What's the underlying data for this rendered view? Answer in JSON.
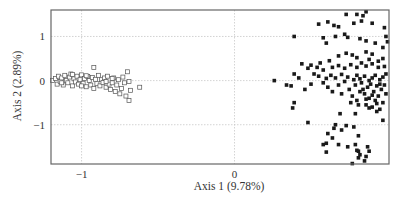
{
  "chart_data": {
    "type": "scatter",
    "title": "",
    "xlabel": "Axis 1 (9.78%)",
    "ylabel": "Axis 2 (2.89%)",
    "xlim": [
      -1.2,
      1.01
    ],
    "ylim": [
      -1.89,
      1.6
    ],
    "xticks": [
      -1,
      0
    ],
    "xtick_labels": [
      "−1",
      "0"
    ],
    "yticks": [
      1,
      0,
      -1
    ],
    "ytick_labels": [
      "1",
      "0",
      "−1"
    ],
    "grid": {
      "vertical_at": [
        -1,
        0
      ],
      "horizontal_at": [
        1,
        0,
        -1
      ],
      "style": "dotted",
      "color": "#c8c8c8"
    },
    "legend": null,
    "series": [
      {
        "name": "group-open-squares",
        "marker": "open-square",
        "color": "#555555",
        "points": [
          [
            -1.19,
            0.0
          ],
          [
            -1.17,
            0.05
          ],
          [
            -1.16,
            -0.08
          ],
          [
            -1.15,
            0.1
          ],
          [
            -1.14,
            -0.02
          ],
          [
            -1.13,
            0.06
          ],
          [
            -1.12,
            -0.1
          ],
          [
            -1.11,
            0.12
          ],
          [
            -1.1,
            0.0
          ],
          [
            -1.09,
            -0.05
          ],
          [
            -1.08,
            0.08
          ],
          [
            -1.07,
            0.15
          ],
          [
            -1.06,
            -0.12
          ],
          [
            -1.05,
            0.04
          ],
          [
            -1.04,
            -0.03
          ],
          [
            -1.03,
            0.1
          ],
          [
            -1.02,
            -0.08
          ],
          [
            -1.01,
            0.02
          ],
          [
            -1.0,
            0.13
          ],
          [
            -0.99,
            -0.06
          ],
          [
            -0.98,
            0.05
          ],
          [
            -0.97,
            -0.14
          ],
          [
            -0.96,
            0.09
          ],
          [
            -0.95,
            0.0
          ],
          [
            -0.94,
            -0.1
          ],
          [
            -0.93,
            0.07
          ],
          [
            -0.92,
            -0.18
          ],
          [
            -0.91,
            0.03
          ],
          [
            -0.9,
            -0.07
          ],
          [
            -0.89,
            0.12
          ],
          [
            -0.88,
            -0.12
          ],
          [
            -0.87,
            0.02
          ],
          [
            -0.86,
            -0.04
          ],
          [
            -0.85,
            0.06
          ],
          [
            -0.84,
            -0.15
          ],
          [
            -0.83,
            0.1
          ],
          [
            -0.82,
            -0.08
          ],
          [
            -0.81,
            -0.2
          ],
          [
            -0.8,
            -0.05
          ],
          [
            -0.79,
            0.06
          ],
          [
            -0.78,
            -0.25
          ],
          [
            -0.77,
            -0.1
          ],
          [
            -0.76,
            0.02
          ],
          [
            -0.75,
            -0.3
          ],
          [
            -0.74,
            -0.18
          ],
          [
            -0.73,
            0.08
          ],
          [
            -0.72,
            -0.05
          ],
          [
            -0.71,
            -0.35
          ],
          [
            -0.7,
            0.2
          ],
          [
            -0.69,
            -0.45
          ],
          [
            -0.69,
            -0.02
          ],
          [
            -0.68,
            -0.22
          ],
          [
            -0.92,
            0.3
          ],
          [
            -0.8,
            0.05
          ],
          [
            -0.84,
            -0.02
          ],
          [
            -1.06,
            0.14
          ],
          [
            -0.62,
            -0.15
          ],
          [
            -1.13,
            -0.05
          ],
          [
            -1.0,
            -0.12
          ],
          [
            -0.97,
            0.11
          ]
        ]
      },
      {
        "name": "group-filled-squares",
        "marker": "filled-square",
        "color": "#1a1a1a",
        "points": [
          [
            0.86,
            1.56
          ],
          [
            0.73,
            1.5
          ],
          [
            0.8,
            1.5
          ],
          [
            0.84,
            1.47
          ],
          [
            0.61,
            1.33
          ],
          [
            0.65,
            1.25
          ],
          [
            0.55,
            1.28
          ],
          [
            0.68,
            1.22
          ],
          [
            0.78,
            1.3
          ],
          [
            0.83,
            1.35
          ],
          [
            0.9,
            1.3
          ],
          [
            0.98,
            1.2
          ],
          [
            0.99,
            1.0
          ],
          [
            0.39,
            1.0
          ],
          [
            0.58,
            0.97
          ],
          [
            0.66,
            1.0
          ],
          [
            0.72,
            1.05
          ],
          [
            0.74,
            0.98
          ],
          [
            0.6,
            0.85
          ],
          [
            0.82,
            0.95
          ],
          [
            0.86,
            0.9
          ],
          [
            0.92,
            0.85
          ],
          [
            0.97,
            0.75
          ],
          [
            1.0,
            0.88
          ],
          [
            0.73,
            0.62
          ],
          [
            0.68,
            0.56
          ],
          [
            0.77,
            0.58
          ],
          [
            0.8,
            0.52
          ],
          [
            0.86,
            0.65
          ],
          [
            0.9,
            0.6
          ],
          [
            0.88,
            0.48
          ],
          [
            0.94,
            0.44
          ],
          [
            0.97,
            0.5
          ],
          [
            0.62,
            0.45
          ],
          [
            0.56,
            0.4
          ],
          [
            0.5,
            0.35
          ],
          [
            0.44,
            0.38
          ],
          [
            0.48,
            0.28
          ],
          [
            0.54,
            0.3
          ],
          [
            0.58,
            0.24
          ],
          [
            0.64,
            0.3
          ],
          [
            0.68,
            0.34
          ],
          [
            0.72,
            0.28
          ],
          [
            0.76,
            0.36
          ],
          [
            0.8,
            0.3
          ],
          [
            0.83,
            0.4
          ],
          [
            0.86,
            0.33
          ],
          [
            0.9,
            0.38
          ],
          [
            0.94,
            0.3
          ],
          [
            0.98,
            0.32
          ],
          [
            0.39,
            0.15
          ],
          [
            0.42,
            0.06
          ],
          [
            0.52,
            0.15
          ],
          [
            0.55,
            0.1
          ],
          [
            0.6,
            0.05
          ],
          [
            0.63,
            0.12
          ],
          [
            0.66,
            0.06
          ],
          [
            0.7,
            0.14
          ],
          [
            0.74,
            0.08
          ],
          [
            0.78,
            0.02
          ],
          [
            0.8,
            0.12
          ],
          [
            0.82,
            0.04
          ],
          [
            0.85,
            0.1
          ],
          [
            0.88,
            0.0
          ],
          [
            0.9,
            0.06
          ],
          [
            0.92,
            0.12
          ],
          [
            0.95,
            0.02
          ],
          [
            0.97,
            0.08
          ],
          [
            0.99,
            0.15
          ],
          [
            0.26,
            0.0
          ],
          [
            0.34,
            -0.1
          ],
          [
            0.37,
            -0.12
          ],
          [
            0.46,
            -0.2
          ],
          [
            0.5,
            -0.08
          ],
          [
            0.58,
            -0.05
          ],
          [
            0.61,
            -0.15
          ],
          [
            0.64,
            -0.25
          ],
          [
            0.68,
            -0.1
          ],
          [
            0.7,
            -0.3
          ],
          [
            0.72,
            -0.02
          ],
          [
            0.75,
            -0.2
          ],
          [
            0.77,
            -0.35
          ],
          [
            0.79,
            -0.1
          ],
          [
            0.8,
            -0.45
          ],
          [
            0.82,
            -0.25
          ],
          [
            0.83,
            -0.05
          ],
          [
            0.85,
            -0.3
          ],
          [
            0.86,
            -0.55
          ],
          [
            0.87,
            -0.15
          ],
          [
            0.88,
            -0.4
          ],
          [
            0.89,
            -0.08
          ],
          [
            0.9,
            -0.6
          ],
          [
            0.91,
            -0.25
          ],
          [
            0.92,
            -0.45
          ],
          [
            0.93,
            -0.12
          ],
          [
            0.94,
            -0.35
          ],
          [
            0.95,
            -0.65
          ],
          [
            0.96,
            -0.2
          ],
          [
            0.97,
            -0.5
          ],
          [
            0.98,
            -0.1
          ],
          [
            0.84,
            -0.2
          ],
          [
            0.86,
            -0.42
          ],
          [
            0.9,
            -0.33
          ],
          [
            0.93,
            -0.52
          ],
          [
            0.88,
            -0.62
          ],
          [
            0.81,
            -0.55
          ],
          [
            0.76,
            -0.5
          ],
          [
            0.95,
            -0.08
          ],
          [
            0.99,
            -0.3
          ],
          [
            0.38,
            -0.62
          ],
          [
            0.39,
            -0.5
          ],
          [
            0.48,
            -0.95
          ],
          [
            0.79,
            -0.75
          ],
          [
            0.93,
            -0.7
          ],
          [
            0.97,
            -0.9
          ],
          [
            0.69,
            -0.75
          ],
          [
            0.66,
            -1.0
          ],
          [
            0.65,
            -1.08
          ],
          [
            0.61,
            -1.2
          ],
          [
            0.64,
            -1.3
          ],
          [
            0.73,
            -1.02
          ],
          [
            0.78,
            -1.05
          ],
          [
            0.81,
            -1.25
          ],
          [
            0.58,
            -1.45
          ],
          [
            0.6,
            -1.42
          ],
          [
            0.68,
            -1.45
          ],
          [
            0.74,
            -1.5
          ],
          [
            0.79,
            -1.45
          ],
          [
            0.87,
            -1.5
          ],
          [
            0.81,
            -1.6
          ],
          [
            0.82,
            -1.68
          ],
          [
            0.86,
            -1.72
          ],
          [
            0.81,
            -1.75
          ],
          [
            0.85,
            -1.82
          ],
          [
            0.8,
            -1.58
          ],
          [
            0.88,
            -1.6
          ],
          [
            0.77,
            -1.88
          ],
          [
            0.6,
            -1.62
          ],
          [
            0.7,
            -1.12
          ]
        ]
      }
    ]
  }
}
